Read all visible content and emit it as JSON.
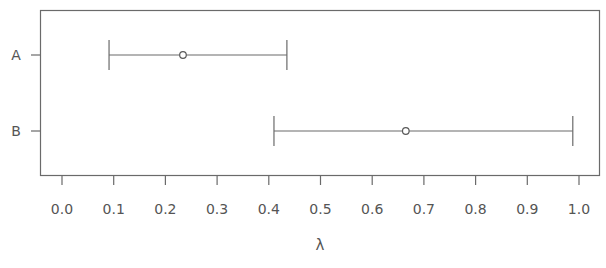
{
  "chart_data": {
    "type": "interval",
    "title": "",
    "xlabel": "λ",
    "ylabel": "",
    "xlim": [
      -0.04,
      1.04
    ],
    "xticks": [
      0.0,
      0.1,
      0.2,
      0.3,
      0.4,
      0.5,
      0.6,
      0.7,
      0.8,
      0.9,
      1.0
    ],
    "xtick_labels": [
      "0.0",
      "0.1",
      "0.2",
      "0.3",
      "0.4",
      "0.5",
      "0.6",
      "0.7",
      "0.8",
      "0.9",
      "1.0"
    ],
    "categories": [
      "A",
      "B"
    ],
    "series": [
      {
        "name": "A",
        "estimate": 0.234,
        "lower": 0.091,
        "upper": 0.435
      },
      {
        "name": "B",
        "estimate": 0.665,
        "lower": 0.41,
        "upper": 0.988
      }
    ],
    "grid": false,
    "legend": "none"
  }
}
